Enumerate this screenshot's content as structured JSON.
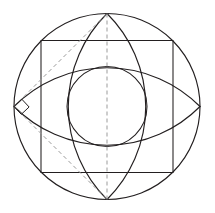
{
  "figure": {
    "canvas": {
      "width": 215,
      "height": 213,
      "background": "#ffffff"
    },
    "colors": {
      "solid_stroke": "#231f20",
      "dashed_stroke": "#9b9b9b",
      "background": "#ffffff"
    },
    "line_widths": {
      "solid": 1.15,
      "thin": 1.05,
      "dashed": 1.0
    }
  },
  "geometry": {
    "center": {
      "x": 107,
      "y": 106.5
    },
    "outer_circle": {
      "cx": 107,
      "cy": 106.5,
      "r": 93,
      "label": "outer-circle"
    },
    "inner_circle": {
      "cx": 107,
      "cy": 106.5,
      "r": 40,
      "label": "inner-circle"
    },
    "cardinal_points": {
      "top": {
        "x": 107,
        "y": 13.5
      },
      "bottom": {
        "x": 107,
        "y": 199.5
      },
      "left": {
        "x": 14,
        "y": 106.5
      },
      "right": {
        "x": 200,
        "y": 106.5
      }
    },
    "inscribed_square": {
      "label": "inscribed-square",
      "points": [
        {
          "x": 41,
          "y": 40.5
        },
        {
          "x": 173,
          "y": 40.5
        },
        {
          "x": 173,
          "y": 172.5
        },
        {
          "x": 41,
          "y": 172.5
        }
      ],
      "side": 132
    },
    "arcs": [
      {
        "name": "arc-from-top",
        "from": "left",
        "to": "right",
        "bulge": "up",
        "radius": 131
      },
      {
        "name": "arc-from-bottom",
        "from": "left",
        "to": "right",
        "bulge": "down",
        "radius": 131
      },
      {
        "name": "arc-from-left",
        "from": "top",
        "to": "bottom",
        "bulge": "left",
        "radius": 131
      },
      {
        "name": "arc-from-right",
        "from": "top",
        "to": "bottom",
        "bulge": "right",
        "radius": 131
      }
    ],
    "dashed_lines": [
      {
        "name": "vertical-diameter",
        "x1": 107,
        "y1": 13.5,
        "x2": 107,
        "y2": 199.5
      },
      {
        "name": "diagonal-upper-left",
        "x1": 14,
        "y1": 106.5,
        "x2": 107,
        "y2": 13.5
      },
      {
        "name": "diagonal-lower-left",
        "x1": 14,
        "y1": 106.5,
        "x2": 107,
        "y2": 199.5
      }
    ],
    "right_angle_marker": {
      "name": "right-angle-marker",
      "vertex": {
        "x": 14,
        "y": 106.5
      },
      "size": 11,
      "points": "14,106.5 21.8,99.2 29.1,107.0 21.3,114.3"
    }
  }
}
